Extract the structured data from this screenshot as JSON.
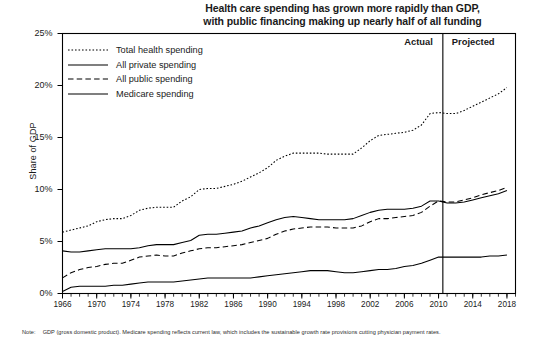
{
  "title": {
    "line1": "Health care spending has grown more rapidly than GDP,",
    "line2": "with public financing making up nearly half of all funding"
  },
  "note": {
    "label": "Note:",
    "text": "GDP (gross domestic product). Medicare spending reflects current law, which includes the sustainable growth rate provisions cutting physician payment rates."
  },
  "annotations": {
    "actual": "Actual",
    "projected": "Projected",
    "divider_year": 2010.5
  },
  "chart_data": {
    "type": "line",
    "title": "Health care spending has grown more rapidly than GDP, with public financing making up nearly half of all funding",
    "xlabel": "",
    "ylabel": "Share of GDP",
    "xlim": [
      1966,
      2019
    ],
    "ylim": [
      0,
      25
    ],
    "yticks": [
      "0%",
      "5%",
      "10%",
      "15%",
      "20%",
      "25%"
    ],
    "ytick_values": [
      0,
      5,
      10,
      15,
      20,
      25
    ],
    "xticks": [
      1966,
      1970,
      1974,
      1978,
      1982,
      1986,
      1990,
      1994,
      1998,
      2002,
      2006,
      2010,
      2014,
      2018
    ],
    "minor_tick_interval": 1,
    "grid": false,
    "legend_position": "upper left",
    "x": [
      1966,
      1967,
      1968,
      1969,
      1970,
      1971,
      1972,
      1973,
      1974,
      1975,
      1976,
      1977,
      1978,
      1979,
      1980,
      1981,
      1982,
      1983,
      1984,
      1985,
      1986,
      1987,
      1988,
      1989,
      1990,
      1991,
      1992,
      1993,
      1994,
      1995,
      1996,
      1997,
      1998,
      1999,
      2000,
      2001,
      2002,
      2003,
      2004,
      2005,
      2006,
      2007,
      2008,
      2009,
      2010,
      2011,
      2012,
      2013,
      2014,
      2015,
      2016,
      2017,
      2018
    ],
    "series": [
      {
        "name": "Total health spending",
        "style": "dotted",
        "values": [
          5.9,
          6.1,
          6.3,
          6.5,
          6.9,
          7.1,
          7.2,
          7.2,
          7.5,
          8.0,
          8.2,
          8.3,
          8.3,
          8.3,
          8.9,
          9.3,
          10.0,
          10.1,
          10.1,
          10.3,
          10.5,
          10.8,
          11.2,
          11.6,
          12.1,
          12.8,
          13.2,
          13.5,
          13.5,
          13.5,
          13.5,
          13.4,
          13.4,
          13.4,
          13.4,
          14.0,
          14.7,
          15.2,
          15.3,
          15.4,
          15.5,
          15.7,
          16.2,
          17.3,
          17.4,
          17.3,
          17.3,
          17.6,
          18.0,
          18.4,
          18.8,
          19.2,
          19.8
        ]
      },
      {
        "name": "All private spending",
        "style": "solid",
        "values": [
          4.1,
          4.0,
          4.0,
          4.1,
          4.2,
          4.3,
          4.3,
          4.3,
          4.3,
          4.4,
          4.6,
          4.7,
          4.7,
          4.7,
          4.9,
          5.1,
          5.6,
          5.7,
          5.7,
          5.8,
          5.9,
          6.0,
          6.3,
          6.5,
          6.8,
          7.1,
          7.3,
          7.4,
          7.3,
          7.2,
          7.1,
          7.1,
          7.1,
          7.1,
          7.2,
          7.5,
          7.8,
          8.0,
          8.1,
          8.1,
          8.1,
          8.2,
          8.4,
          8.9,
          8.9,
          8.7,
          8.7,
          8.8,
          9.0,
          9.2,
          9.4,
          9.6,
          9.9
        ]
      },
      {
        "name": "All public spending",
        "style": "dashed",
        "values": [
          1.5,
          2.0,
          2.3,
          2.5,
          2.6,
          2.8,
          2.9,
          2.9,
          3.2,
          3.5,
          3.6,
          3.7,
          3.6,
          3.6,
          3.9,
          4.1,
          4.3,
          4.4,
          4.4,
          4.5,
          4.6,
          4.7,
          4.9,
          5.1,
          5.3,
          5.7,
          6.0,
          6.2,
          6.3,
          6.4,
          6.4,
          6.4,
          6.3,
          6.3,
          6.3,
          6.5,
          6.9,
          7.2,
          7.2,
          7.3,
          7.4,
          7.5,
          7.8,
          8.4,
          8.9,
          8.8,
          8.8,
          9.0,
          9.2,
          9.5,
          9.7,
          9.9,
          10.2
        ]
      },
      {
        "name": "Medicare spending",
        "style": "solid",
        "values": [
          0.2,
          0.6,
          0.7,
          0.7,
          0.7,
          0.7,
          0.8,
          0.8,
          0.9,
          1.0,
          1.1,
          1.1,
          1.1,
          1.1,
          1.2,
          1.3,
          1.4,
          1.5,
          1.5,
          1.5,
          1.5,
          1.5,
          1.5,
          1.6,
          1.7,
          1.8,
          1.9,
          2.0,
          2.1,
          2.2,
          2.2,
          2.2,
          2.1,
          2.0,
          2.0,
          2.1,
          2.2,
          2.3,
          2.3,
          2.4,
          2.6,
          2.7,
          2.9,
          3.2,
          3.5,
          3.5,
          3.5,
          3.5,
          3.5,
          3.5,
          3.6,
          3.6,
          3.7
        ]
      }
    ]
  }
}
